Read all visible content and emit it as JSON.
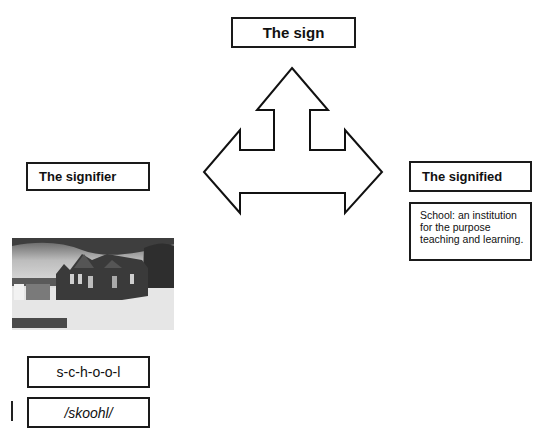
{
  "sign": {
    "label": "The sign"
  },
  "signifier": {
    "label": "The signifier",
    "image_alt": "school-building-photo",
    "spelling": "s-c-h-o-o-l",
    "phonetic": "/skoohl/"
  },
  "signified": {
    "label": "The signified",
    "description": "School: an institution for the purpose teaching and learning."
  },
  "colors": {
    "stroke": "#1a1a1a",
    "background": "#ffffff"
  }
}
